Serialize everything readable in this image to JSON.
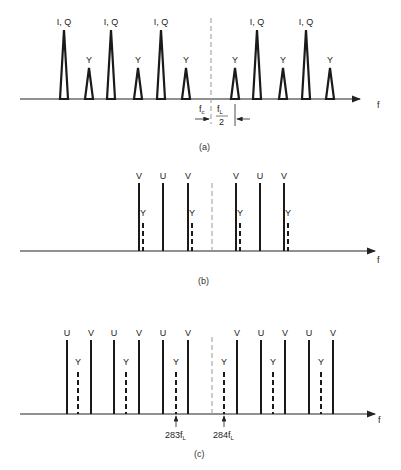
{
  "figure": {
    "panels": [
      {
        "id": "a",
        "caption": "(a)",
        "axis_label": "f",
        "center_label": "f",
        "center_sub": "c",
        "spacing_num": "f",
        "spacing_num_sub": "L",
        "spacing_den": "2",
        "peaks": [
          {
            "x": 64,
            "label": "I, Q",
            "kind": "tall"
          },
          {
            "x": 89,
            "label": "Y",
            "kind": "short"
          },
          {
            "x": 111,
            "label": "I, Q",
            "kind": "tall"
          },
          {
            "x": 138,
            "label": "Y",
            "kind": "short"
          },
          {
            "x": 161,
            "label": "I, Q",
            "kind": "tall"
          },
          {
            "x": 186,
            "label": "Y",
            "kind": "short"
          },
          {
            "x": 235,
            "label": "Y",
            "kind": "short"
          },
          {
            "x": 257,
            "label": "I, Q",
            "kind": "tall"
          },
          {
            "x": 283,
            "label": "Y",
            "kind": "short"
          },
          {
            "x": 306,
            "label": "I, Q",
            "kind": "tall"
          },
          {
            "x": 330,
            "label": "Y",
            "kind": "short"
          }
        ]
      },
      {
        "id": "b",
        "caption": "(b)",
        "axis_label": "f",
        "lines": [
          {
            "x": 139,
            "label": "V",
            "kind": "solid"
          },
          {
            "x": 143,
            "label": "Y",
            "kind": "dashed"
          },
          {
            "x": 163,
            "label": "U",
            "kind": "solid"
          },
          {
            "x": 188,
            "label": "V",
            "kind": "solid"
          },
          {
            "x": 192,
            "label": "Y",
            "kind": "dashed"
          },
          {
            "x": 236,
            "label": "V",
            "kind": "solid"
          },
          {
            "x": 240,
            "label": "Y",
            "kind": "dashed"
          },
          {
            "x": 260,
            "label": "U",
            "kind": "solid"
          },
          {
            "x": 284,
            "label": "V",
            "kind": "solid"
          },
          {
            "x": 288,
            "label": "Y",
            "kind": "dashed"
          }
        ]
      },
      {
        "id": "c",
        "caption": "(c)",
        "axis_label": "f",
        "marker_left": "283f",
        "marker_right": "284f",
        "marker_sub": "L",
        "lines": [
          {
            "x": 67,
            "label": "U",
            "kind": "solid"
          },
          {
            "x": 78,
            "label": "Y",
            "kind": "dashed"
          },
          {
            "x": 91,
            "label": "V",
            "kind": "solid"
          },
          {
            "x": 114,
            "label": "U",
            "kind": "solid"
          },
          {
            "x": 126,
            "label": "Y",
            "kind": "dashed"
          },
          {
            "x": 139,
            "label": "V",
            "kind": "solid"
          },
          {
            "x": 163,
            "label": "U",
            "kind": "solid"
          },
          {
            "x": 176,
            "label": "Y",
            "kind": "dashed"
          },
          {
            "x": 188,
            "label": "V",
            "kind": "solid"
          },
          {
            "x": 224,
            "label": "Y",
            "kind": "dashed"
          },
          {
            "x": 237,
            "label": "V",
            "kind": "solid"
          },
          {
            "x": 261,
            "label": "U",
            "kind": "solid"
          },
          {
            "x": 273,
            "label": "Y",
            "kind": "dashed"
          },
          {
            "x": 285,
            "label": "V",
            "kind": "solid"
          },
          {
            "x": 309,
            "label": "U",
            "kind": "solid"
          },
          {
            "x": 321,
            "label": "Y",
            "kind": "dashed"
          },
          {
            "x": 333,
            "label": "V",
            "kind": "solid"
          }
        ]
      }
    ]
  }
}
